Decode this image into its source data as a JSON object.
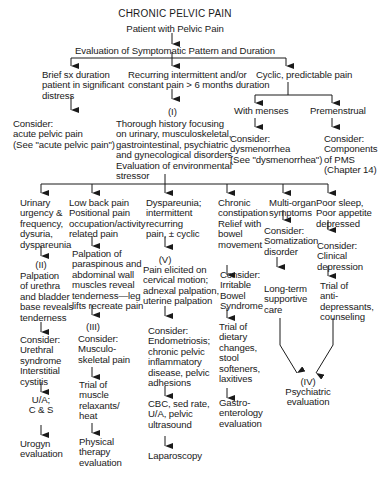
{
  "title": "CHRONIC PELVIC PAIN",
  "start": "Patient with Pelvic Pain",
  "evaluation": "Evaluation of Symptomatic Pattern and Duration",
  "level1": {
    "brief": "Brief sx duration\npatient in significant\ndistress",
    "recurring": "Recurring intermittent and/or\nconstant pain > 6 months duration",
    "cyclic": "Cyclic, predictable pain"
  },
  "acute": "Consider:\nacute pelvic pain\n(See \"acute pelvic pain\")",
  "step_I_label": "(I)",
  "history": "Thorough history focusing\non urinary, musculoskeletal,\ngastrointestinal, psychiatric\nand gynecological disorders\nEvaluation of environmental\nstressor",
  "cyclic_branches": {
    "menses": "With menses",
    "premenstrual": "Premenstrual",
    "dysmenorrhea": "Consider:\ndysmenorrhea\n(See \"dysmenorrhea\")",
    "pms": "Consider:\nComponents\nof PMS\n(Chapter 14)"
  },
  "columns": [
    {
      "symptom": "Urinary\nurgency &\nfrequency,\ndysuria,\ndyspareunia",
      "step": "(II)",
      "exam": "Palpation\nof urethra\nand bladder\nbase reveals\ntenderness",
      "consider": "Consider:\nUrethral\nsyndrome\nInterstitial\ncystitis",
      "test": "U/A;\nC & S",
      "final": "Urogyn\nevaluation"
    },
    {
      "symptom": "Low back pain\nPositional pain\noccupation/activity\nrelated pain",
      "exam": "Palpation of\nparaspinous and\nabdominal wall\nmuscles reveal\ntenderness—leg\nlifts recreate pain",
      "step": "(III)",
      "consider": "Consider:\nMusculo-\nskeletal pain",
      "treatment": "Trial of\nmuscle\nrelaxants/\nheat",
      "final": "Physical\ntherapy\nevaluation"
    },
    {
      "symptom": "Dyspareunia;\nintermittent\nrecurring\npain, ± cyclic",
      "step": "(V)",
      "exam": "Pain elicited on\ncervical motion;\nadnexal palpation,\nuterine palpation",
      "consider": "Consider:\nEndometriosis;\nchronic pelvic\ninflammatory\ndisease, pelvic\nadhesions",
      "test": "CBC, sed rate,\nU/A, pelvic\nultrasound",
      "final": "Laparoscopy"
    },
    {
      "symptom": "Chronic\nconstipation\nRelief with\nbowel\nmovement",
      "consider": "Consider:\nIrritable\nBowel\nSyndrome",
      "treatment": "Trial of\ndietary\nchanges,\nstool\nsofteners,\nlaxitives",
      "final": "Gastro-\nenterology\nevaluation"
    },
    {
      "symptom": "Multi-organ\nsymptoms",
      "consider": "Consider:\nSomatization\ndisorder",
      "treatment": "Long-term\nsupportive\ncare"
    },
    {
      "symptom": "Poor sleep,\nPoor appetite\ndepressed",
      "consider": "Consider:\nClinical\ndepression",
      "treatment": "Trial of\nanti-\ndepressants,\ncounseling"
    }
  ],
  "psychiatric": {
    "step": "(IV)",
    "label": "Psychiatric\nevaluation"
  },
  "colors": {
    "ink": "#1a1a1a",
    "background": "#ffffff"
  }
}
